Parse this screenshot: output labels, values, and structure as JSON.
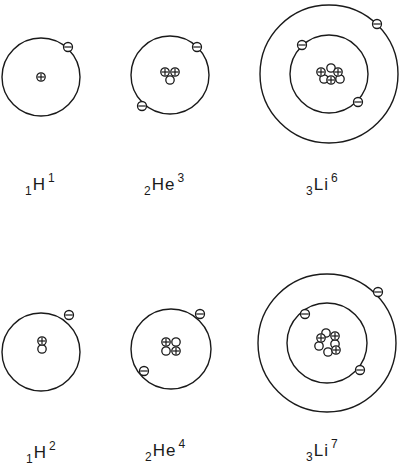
{
  "figure": {
    "title": "",
    "colors": {
      "line": "#1a1a1a",
      "background": "#ffffff"
    },
    "atoms": [
      {
        "id": "h1",
        "symbol": "H",
        "atomic_number": "1",
        "mass_number": "1",
        "label_pos": [
          25,
          176
        ],
        "center": [
          41,
          77
        ],
        "orbits": [
          39
        ],
        "electrons": [
          [
            68,
            47
          ]
        ],
        "nucleus": {
          "protons": [
            [
              41,
              77
            ]
          ],
          "neutrons": []
        }
      },
      {
        "id": "he3",
        "symbol": "He",
        "atomic_number": "2",
        "mass_number": "3",
        "label_pos": [
          144,
          176
        ],
        "center": [
          170,
          75
        ],
        "orbits": [
          39
        ],
        "electrons": [
          [
            197,
            47
          ],
          [
            142,
            106
          ]
        ],
        "nucleus": {
          "protons": [
            [
              165,
              72
            ],
            [
              175,
              72
            ]
          ],
          "neutrons": [
            [
              170,
              80
            ]
          ]
        }
      },
      {
        "id": "li6",
        "symbol": "Li",
        "atomic_number": "3",
        "mass_number": "6",
        "label_pos": [
          306,
          176
        ],
        "center": [
          329,
          74
        ],
        "orbits": [
          39,
          69
        ],
        "electrons": [
          [
            302,
            45
          ],
          [
            358,
            102
          ],
          [
            377,
            24
          ]
        ],
        "nucleus": {
          "protons": [
            [
              321,
              72
            ],
            [
              338,
              72
            ],
            [
              331,
              80
            ]
          ],
          "neutrons": [
            [
              331,
              68
            ],
            [
              324,
              79
            ],
            [
              340,
              79
            ]
          ]
        }
      },
      {
        "id": "h2",
        "symbol": "H",
        "atomic_number": "1",
        "mass_number": "2",
        "label_pos": [
          26,
          444
        ],
        "center": [
          41,
          352
        ],
        "orbits": [
          39
        ],
        "electrons": [
          [
            69,
            315
          ]
        ],
        "nucleus": {
          "protons": [
            [
              42,
              341
            ]
          ],
          "neutrons": [
            [
              42,
              349
            ]
          ]
        }
      },
      {
        "id": "he4",
        "symbol": "He",
        "atomic_number": "2",
        "mass_number": "4",
        "label_pos": [
          145,
          442
        ],
        "center": [
          171,
          349
        ],
        "orbits": [
          40
        ],
        "electrons": [
          [
            200,
            314
          ],
          [
            144,
            371
          ]
        ],
        "nucleus": {
          "protons": [
            [
              166,
              342
            ],
            [
              176,
              351
            ]
          ],
          "neutrons": [
            [
              176,
              342
            ],
            [
              166,
              351
            ]
          ]
        }
      },
      {
        "id": "li7",
        "symbol": "Li",
        "atomic_number": "3",
        "mass_number": "7",
        "label_pos": [
          306,
          442
        ],
        "center": [
          327,
          343
        ],
        "orbits": [
          40,
          69
        ],
        "electrons": [
          [
            305,
            314
          ],
          [
            360,
            370
          ],
          [
            378,
            292
          ]
        ],
        "nucleus": {
          "protons": [
            [
              321,
              338
            ],
            [
              335,
              336
            ],
            [
              336,
              350
            ]
          ],
          "neutrons": [
            [
              326,
              333
            ],
            [
              319,
              346
            ],
            [
              328,
              352
            ],
            [
              335,
              344
            ]
          ]
        }
      }
    ]
  }
}
